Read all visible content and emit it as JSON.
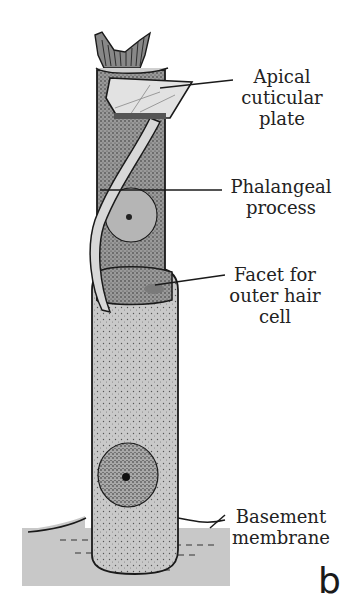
{
  "figure": {
    "panel_letter": "b",
    "colors": {
      "background": "#ffffff",
      "cell_body_light": "#c9c9c9",
      "cell_body_dark": "#9a9a9a",
      "basement_membrane": "#c8c8c8",
      "outline": "#1a1a1a",
      "text": "#222222"
    }
  },
  "labels": {
    "apical_cuticular_plate": "Apical\ncuticular\nplate",
    "phalangeal_process": "Phalangeal\nprocess",
    "facet_for_outer_hair_cell": "Facet for\nouter hair\ncell",
    "basement_membrane": "Basement\nmembrane"
  }
}
